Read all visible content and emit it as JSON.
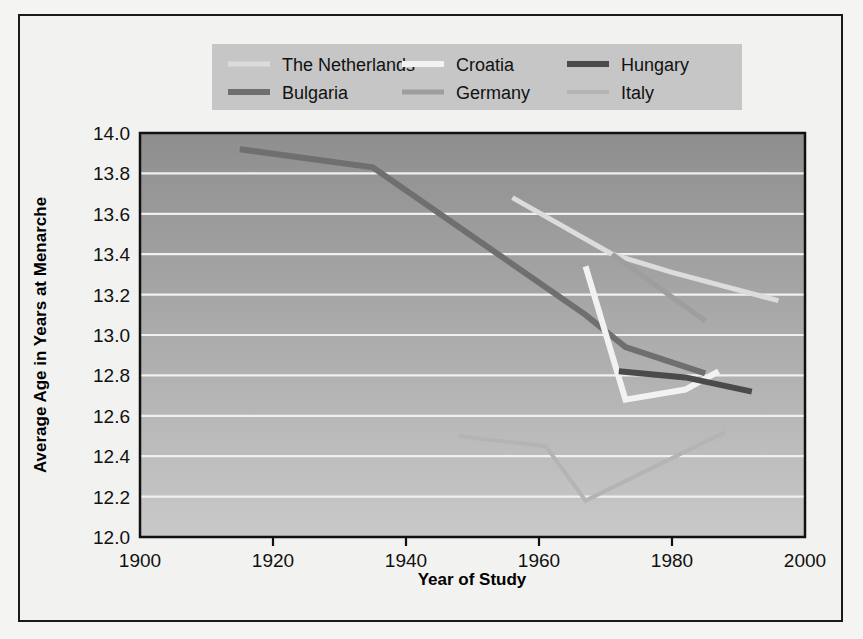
{
  "figure": {
    "background_color": "#f2f2f0",
    "border_color": "#1a1a1a"
  },
  "chart_data": {
    "type": "line",
    "title": "",
    "xlabel": "Year of Study",
    "ylabel": "Average Age in Years at Menarche",
    "xlim": [
      1900,
      2000
    ],
    "ylim": [
      12.0,
      14.0
    ],
    "xticks": [
      1900,
      1920,
      1940,
      1960,
      1980,
      2000
    ],
    "yticks": [
      12.0,
      12.2,
      12.4,
      12.6,
      12.8,
      13.0,
      13.2,
      13.4,
      13.6,
      13.8,
      14.0
    ],
    "xtick_labels": [
      "1900",
      "1920",
      "1940",
      "1960",
      "1980",
      "2000"
    ],
    "ytick_labels": [
      "12.0",
      "12.2",
      "12.4",
      "12.6",
      "12.8",
      "13.0",
      "13.2",
      "13.4",
      "13.6",
      "13.8",
      "14.0"
    ],
    "grid": true,
    "grid_color": "#f0f0f0",
    "legend_position": "top",
    "plot_bg_gradient_top": "#8e8e8e",
    "plot_bg_gradient_bottom": "#c8c8c8",
    "series": [
      {
        "name": "The Netherlands",
        "color": "#dcdcdc",
        "width": 5,
        "x": [
          1956,
          1971,
          1980,
          1996
        ],
        "y": [
          13.68,
          13.4,
          13.31,
          13.17
        ]
      },
      {
        "name": "Bulgaria",
        "color": "#6f6f6f",
        "width": 6,
        "x": [
          1915,
          1935,
          1967,
          1973,
          1985
        ],
        "y": [
          13.92,
          13.83,
          13.1,
          12.94,
          12.81
        ]
      },
      {
        "name": "Croatia",
        "color": "#f2f2f2",
        "width": 6,
        "x": [
          1967,
          1973,
          1982,
          1987
        ],
        "y": [
          13.34,
          12.68,
          12.73,
          12.82
        ]
      },
      {
        "name": "Germany",
        "color": "#9e9e9e",
        "width": 5,
        "x": [
          1971,
          1985
        ],
        "y": [
          13.4,
          13.07
        ]
      },
      {
        "name": "Hungary",
        "color": "#4a4a4a",
        "width": 6,
        "x": [
          1972,
          1982,
          1992
        ],
        "y": [
          12.82,
          12.79,
          12.72
        ]
      },
      {
        "name": "Italy",
        "color": "#b4b4b4",
        "width": 4,
        "x": [
          1948,
          1961,
          1967,
          1988
        ],
        "y": [
          12.5,
          12.45,
          12.18,
          12.52
        ]
      }
    ]
  },
  "legend": {
    "background_color": "#c6c6c6",
    "entries": [
      {
        "label": "The Netherlands",
        "color": "#dcdcdc",
        "width": 5
      },
      {
        "label": "Croatia",
        "color": "#f2f2f2",
        "width": 6
      },
      {
        "label": "Hungary",
        "color": "#4a4a4a",
        "width": 6
      },
      {
        "label": "Bulgaria",
        "color": "#6f6f6f",
        "width": 6
      },
      {
        "label": "Germany",
        "color": "#9e9e9e",
        "width": 5
      },
      {
        "label": "Italy",
        "color": "#b4b4b4",
        "width": 4
      }
    ]
  }
}
